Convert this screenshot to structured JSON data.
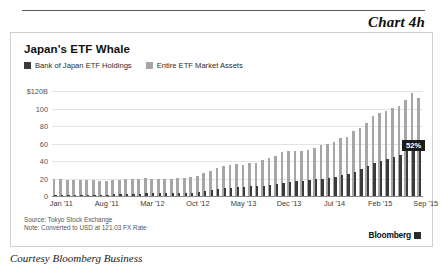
{
  "header": {
    "chart_number": "Chart 4h"
  },
  "card": {
    "title": "Japan's ETF Whale",
    "legend": [
      {
        "label": "Bank of Japan ETF Holdings",
        "color": "#3b3b3b",
        "icon": "legend-swatch-icon"
      },
      {
        "label": "Entire ETF Market Assets",
        "color": "#a6a6a6",
        "icon": "legend-swatch-icon"
      }
    ],
    "footnotes": [
      "Source: Tokyo Stock Exchange",
      "Note: Converted to USD at 121.03 FX Rate"
    ],
    "brand": {
      "name": "Bloomberg",
      "mark": "bloomberg-square-icon"
    }
  },
  "caption": "Courtesy Bloomberg Business",
  "chart_data": {
    "type": "bar",
    "title": "Japan's ETF Whale",
    "xlabel": "",
    "ylabel": "",
    "ylim": [
      0,
      120
    ],
    "yticks": [
      "0",
      "20",
      "40",
      "60",
      "80",
      "100",
      "$120B"
    ],
    "ytick_values": [
      0,
      20,
      40,
      60,
      80,
      100,
      120
    ],
    "grid": true,
    "legend_position": "top-left",
    "annotations": [
      {
        "text": "52%",
        "series": "Bank of Japan ETF Holdings",
        "at_category": "Aug '15"
      }
    ],
    "xtick_labels": [
      "Jan '11",
      "Aug '11",
      "Mar '12",
      "Oct '12",
      "May '13",
      "Dec '13",
      "Jul '14",
      "Feb '15",
      "Sep '15"
    ],
    "xtick_indices": [
      0,
      7,
      14,
      21,
      28,
      35,
      42,
      49,
      56
    ],
    "categories": [
      "Jan '11",
      "Feb '11",
      "Mar '11",
      "Apr '11",
      "May '11",
      "Jun '11",
      "Jul '11",
      "Aug '11",
      "Sep '11",
      "Oct '11",
      "Nov '11",
      "Dec '11",
      "Jan '12",
      "Feb '12",
      "Mar '12",
      "Apr '12",
      "May '12",
      "Jun '12",
      "Jul '12",
      "Aug '12",
      "Sep '12",
      "Oct '12",
      "Nov '12",
      "Dec '12",
      "Jan '13",
      "Feb '13",
      "Mar '13",
      "Apr '13",
      "May '13",
      "Jun '13",
      "Jul '13",
      "Aug '13",
      "Sep '13",
      "Oct '13",
      "Nov '13",
      "Dec '13",
      "Jan '14",
      "Feb '14",
      "Mar '14",
      "Apr '14",
      "May '14",
      "Jun '14",
      "Jul '14",
      "Aug '14",
      "Sep '14",
      "Oct '14",
      "Nov '14",
      "Dec '14",
      "Jan '15",
      "Feb '15",
      "Mar '15",
      "Apr '15",
      "May '15",
      "Jun '15",
      "Jul '15",
      "Aug '15",
      "Sep '15"
    ],
    "series": [
      {
        "name": "Entire ETF Market Assets",
        "color": "#a6a6a6",
        "values": [
          19,
          19,
          18,
          18,
          18,
          18,
          18,
          17,
          17,
          18,
          18,
          19,
          19,
          20,
          21,
          20,
          20,
          20,
          20,
          21,
          21,
          22,
          23,
          26,
          29,
          32,
          34,
          36,
          37,
          36,
          38,
          38,
          41,
          43,
          46,
          50,
          51,
          52,
          52,
          53,
          55,
          58,
          60,
          62,
          66,
          68,
          74,
          78,
          83,
          92,
          95,
          97,
          101,
          103,
          110,
          118,
          112
        ]
      },
      {
        "name": "Bank of Japan ETF Holdings",
        "color": "#3b3b3b",
        "values": [
          1,
          1,
          1,
          1,
          1,
          1,
          1,
          1,
          1,
          2,
          2,
          2,
          2,
          2,
          3,
          3,
          3,
          3,
          3,
          4,
          4,
          4,
          5,
          6,
          7,
          8,
          9,
          9,
          10,
          10,
          11,
          11,
          12,
          13,
          14,
          15,
          16,
          17,
          17,
          18,
          19,
          20,
          21,
          22,
          24,
          25,
          28,
          31,
          34,
          38,
          40,
          42,
          45,
          47,
          52,
          61,
          58
        ]
      }
    ]
  }
}
